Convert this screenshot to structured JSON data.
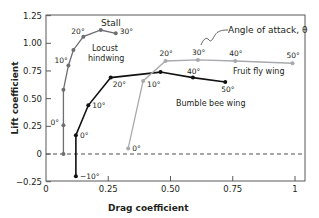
{
  "chart_data": {
    "type": "line",
    "title": "",
    "xlabel": "Drag coefficient",
    "ylabel": "Lift coefficient",
    "xlim": [
      0,
      1.03
    ],
    "ylim": [
      -0.25,
      1.25
    ],
    "x_ticks": [
      "0",
      "0.25",
      "0.50",
      "0.75",
      "1"
    ],
    "x_tick_values": [
      0,
      0.25,
      0.5,
      0.75,
      1
    ],
    "y_ticks": [
      "1.25",
      "1.00",
      "0.75",
      "0.50",
      "0.25",
      "0",
      "−0.25"
    ],
    "y_tick_values": [
      1.25,
      1.0,
      0.75,
      0.5,
      0.25,
      0,
      -0.25
    ],
    "grid": false,
    "zero_line": "dashed",
    "annotations": [
      {
        "text": "Stall",
        "x": 0.22,
        "y": 1.12
      },
      {
        "text": "Angle of attack, θ",
        "x": 0.62,
        "y": 1.15
      }
    ],
    "series": [
      {
        "name": "Locust hindwing",
        "color": "#6d6e71",
        "points": [
          {
            "x": 0.07,
            "y": 0.0,
            "label": ""
          },
          {
            "x": 0.07,
            "y": 0.26,
            "label": "0°"
          },
          {
            "x": 0.07,
            "y": 0.58,
            "label": ""
          },
          {
            "x": 0.09,
            "y": 0.8,
            "label": "10°"
          },
          {
            "x": 0.11,
            "y": 0.94,
            "label": ""
          },
          {
            "x": 0.15,
            "y": 1.06,
            "label": "20°"
          },
          {
            "x": 0.22,
            "y": 1.12,
            "label": ""
          },
          {
            "x": 0.28,
            "y": 1.09,
            "label": "30°"
          }
        ]
      },
      {
        "name": "Bumble bee wing",
        "color": "#111111",
        "points": [
          {
            "x": 0.12,
            "y": -0.2,
            "label": "−10°"
          },
          {
            "x": 0.12,
            "y": 0.17,
            "label": "0°"
          },
          {
            "x": 0.17,
            "y": 0.44,
            "label": "10°"
          },
          {
            "x": 0.26,
            "y": 0.69,
            "label": "20°"
          },
          {
            "x": 0.46,
            "y": 0.74,
            "label": ""
          },
          {
            "x": 0.59,
            "y": 0.69,
            "label": "40°"
          },
          {
            "x": 0.72,
            "y": 0.65,
            "label": "50°"
          }
        ]
      },
      {
        "name": "Fruit fly wing",
        "color": "#a7a9ac",
        "points": [
          {
            "x": 0.33,
            "y": 0.05,
            "label": "0°"
          },
          {
            "x": 0.39,
            "y": 0.66,
            "label": "10°"
          },
          {
            "x": 0.48,
            "y": 0.84,
            "label": "20°"
          },
          {
            "x": 0.61,
            "y": 0.85,
            "label": "30°"
          },
          {
            "x": 0.76,
            "y": 0.84,
            "label": "40°"
          },
          {
            "x": 0.99,
            "y": 0.82,
            "label": "50°"
          }
        ]
      }
    ]
  },
  "labels": {
    "stall": "Stall",
    "locust_line1": "Locust",
    "locust_line2": "hindwing",
    "bumble": "Bumble bee wing",
    "fruitfly": "Fruit fly wing",
    "angle": "Angle of attack, θ",
    "xlabel": "Drag coefficient",
    "ylabel": "Lift coefficient"
  }
}
